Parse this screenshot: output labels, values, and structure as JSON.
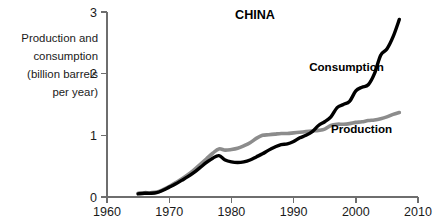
{
  "chart_data": {
    "type": "line",
    "title": "CHINA",
    "xlabel": "",
    "ylabel": "Production and consumption (billion barrels per year)",
    "ylabel_lines": [
      "Production and",
      "consumption",
      "(billion barrels",
      "per year)"
    ],
    "xlim": [
      1960,
      2010
    ],
    "ylim": [
      0,
      3
    ],
    "xticks": [
      1960,
      1970,
      1980,
      1990,
      2000,
      2010
    ],
    "xtick_labels": [
      "1960",
      "1970",
      "1980",
      "1990",
      "2000",
      "2010"
    ],
    "yticks": [
      0,
      1,
      2,
      3
    ],
    "ytick_labels": [
      "0",
      "1",
      "2",
      "3"
    ],
    "grid": false,
    "legend_position": "inline-annotations",
    "colors": {
      "consumption": "#000000",
      "production": "#8c8c8c",
      "axis": "#6e6e6e",
      "text": "#1a1a1a",
      "background": "#ffffff"
    },
    "series": [
      {
        "name": "Production",
        "label": "Production",
        "color": "#8c8c8c",
        "label_x": 1996.0,
        "label_y": 1.03,
        "x": [
          1965,
          1966,
          1967,
          1968,
          1969,
          1970,
          1971,
          1972,
          1973,
          1974,
          1975,
          1976,
          1977,
          1978,
          1979,
          1980,
          1981,
          1982,
          1983,
          1984,
          1985,
          1986,
          1987,
          1988,
          1989,
          1990,
          1991,
          1992,
          1993,
          1994,
          1995,
          1996,
          1997,
          1998,
          1999,
          2000,
          2001,
          2002,
          2003,
          2004,
          2005,
          2006,
          2007
        ],
        "values": [
          0.06,
          0.07,
          0.07,
          0.08,
          0.12,
          0.17,
          0.23,
          0.29,
          0.36,
          0.44,
          0.53,
          0.62,
          0.71,
          0.78,
          0.76,
          0.77,
          0.79,
          0.83,
          0.88,
          0.95,
          1.0,
          1.01,
          1.02,
          1.03,
          1.03,
          1.04,
          1.05,
          1.06,
          1.07,
          1.08,
          1.1,
          1.16,
          1.18,
          1.18,
          1.19,
          1.21,
          1.22,
          1.24,
          1.25,
          1.27,
          1.3,
          1.34,
          1.37
        ]
      },
      {
        "name": "Consumption",
        "label": "Consumption",
        "color": "#000000",
        "label_x": 1992.5,
        "label_y": 2.05,
        "x": [
          1965,
          1966,
          1967,
          1968,
          1969,
          1970,
          1971,
          1972,
          1973,
          1974,
          1975,
          1976,
          1977,
          1978,
          1979,
          1980,
          1981,
          1982,
          1983,
          1984,
          1985,
          1986,
          1987,
          1988,
          1989,
          1990,
          1991,
          1992,
          1993,
          1994,
          1995,
          1996,
          1997,
          1998,
          1999,
          2000,
          2001,
          2002,
          2003,
          2004,
          2005,
          2006,
          2007
        ],
        "values": [
          0.05,
          0.06,
          0.06,
          0.07,
          0.11,
          0.16,
          0.21,
          0.27,
          0.33,
          0.4,
          0.48,
          0.56,
          0.63,
          0.67,
          0.6,
          0.57,
          0.56,
          0.57,
          0.6,
          0.65,
          0.7,
          0.76,
          0.81,
          0.85,
          0.86,
          0.9,
          0.96,
          1.0,
          1.06,
          1.16,
          1.22,
          1.3,
          1.45,
          1.5,
          1.55,
          1.72,
          1.78,
          1.82,
          2.0,
          2.3,
          2.4,
          2.6,
          2.88
        ]
      }
    ]
  }
}
